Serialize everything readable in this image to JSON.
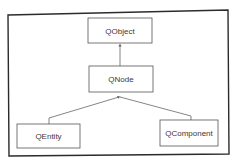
{
  "diagram": {
    "type": "class-hierarchy",
    "nodes": [
      {
        "id": "qobject",
        "label": "QObject"
      },
      {
        "id": "qnode",
        "label": "QNode"
      },
      {
        "id": "qentity",
        "label": "QEntity"
      },
      {
        "id": "qcomponent",
        "label": "QComponent"
      }
    ],
    "edges": [
      {
        "from": "qnode",
        "to": "qobject",
        "style": "arrow"
      },
      {
        "from": "qentity",
        "to": "qnode",
        "style": "arrow"
      },
      {
        "from": "qcomponent",
        "to": "qnode",
        "style": "arrow"
      }
    ],
    "colors": {
      "frame": "#2b2b2b",
      "box_border": "#555555",
      "edge": "#666666",
      "text": "#3a3a3a",
      "background": "#ffffff"
    }
  }
}
